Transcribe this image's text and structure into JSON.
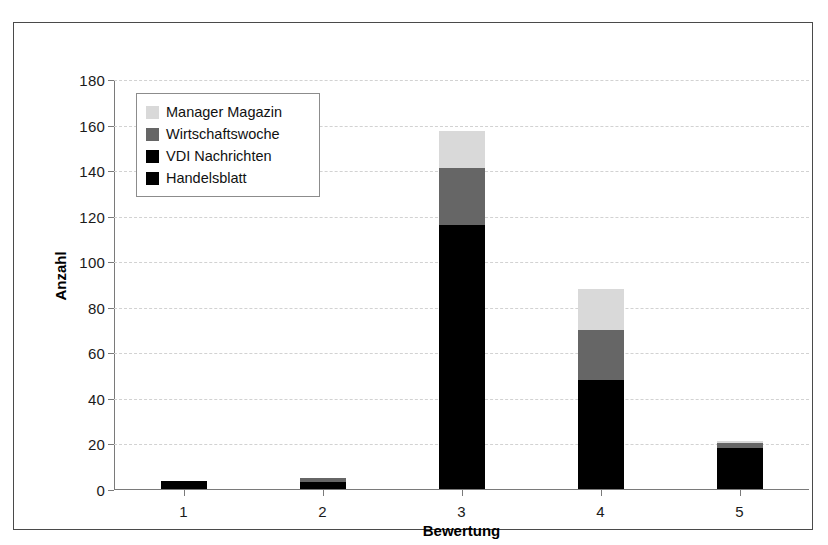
{
  "chart_data": {
    "type": "bar",
    "stacked": true,
    "title": "",
    "xlabel": "Bewertung",
    "ylabel": "Anzahl",
    "categories": [
      "1",
      "2",
      "3",
      "4",
      "5"
    ],
    "ylim": [
      0,
      180
    ],
    "yticks": [
      0,
      20,
      40,
      60,
      80,
      100,
      120,
      140,
      160,
      180
    ],
    "grid": true,
    "grid_axis": "y",
    "legend_position": "upper left",
    "series": [
      {
        "name": "Handelsblatt",
        "color": "#000000",
        "values": [
          3.5,
          3,
          116,
          48,
          18
        ]
      },
      {
        "name": "VDI Nachrichten",
        "color": "#000000",
        "values": [
          0,
          0,
          0,
          0,
          0
        ]
      },
      {
        "name": "Wirtschaftswoche",
        "color": "#666666",
        "values": [
          0,
          2,
          25,
          22,
          2
        ]
      },
      {
        "name": "Manager Magazin",
        "color": "#d9d9d9",
        "values": [
          0,
          0,
          16,
          18,
          1
        ]
      }
    ],
    "legend_entries": [
      {
        "label": "Manager Magazin",
        "color": "#d9d9d9"
      },
      {
        "label": "Wirtschaftswoche",
        "color": "#666666"
      },
      {
        "label": "VDI Nachrichten",
        "color": "#000000"
      },
      {
        "label": "Handelsblatt",
        "color": "#000000"
      }
    ],
    "totals": [
      3.5,
      5,
      157,
      88,
      21
    ]
  },
  "axis": {
    "y_title": "Anzahl",
    "x_title": "Bewertung",
    "y_tick_labels": [
      "180",
      "160",
      "140",
      "120",
      "100",
      "80",
      "60",
      "40",
      "20",
      "0"
    ],
    "x_tick_labels": [
      "1",
      "2",
      "3",
      "4",
      "5"
    ]
  },
  "legend": {
    "items": [
      {
        "label": "Manager Magazin"
      },
      {
        "label": "Wirtschaftswoche"
      },
      {
        "label": "VDI Nachrichten"
      },
      {
        "label": "Handelsblatt"
      }
    ]
  }
}
